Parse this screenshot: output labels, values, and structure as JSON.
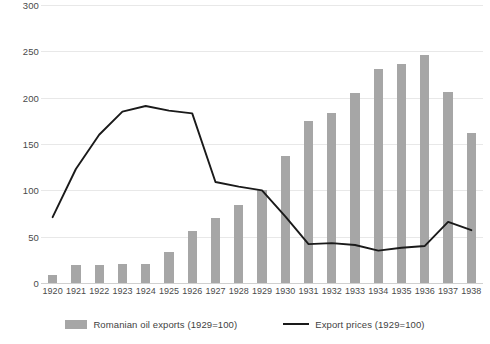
{
  "chart_data": {
    "type": "bar",
    "title": "",
    "xlabel": "",
    "ylabel": "",
    "ylim": [
      0,
      300
    ],
    "yticks": [
      0,
      50,
      100,
      150,
      200,
      250,
      300
    ],
    "grid": true,
    "legend_position": "bottom",
    "categories": [
      "1920",
      "1921",
      "1922",
      "1923",
      "1924",
      "1925",
      "1926",
      "1927",
      "1928",
      "1929",
      "1930",
      "1931",
      "1932",
      "1933",
      "1934",
      "1935",
      "1936",
      "1937",
      "1938"
    ],
    "series": [
      {
        "name": "Romanian oil exports (1929=100)",
        "type": "bar",
        "color": "#a6a6a6",
        "values": [
          9,
          19,
          19,
          21,
          20,
          34,
          56,
          70,
          84,
          100,
          137,
          175,
          183,
          205,
          231,
          236,
          246,
          206,
          162
        ]
      },
      {
        "name": "Export prices (1929=100)",
        "type": "line",
        "color": "#1a1a1a",
        "values": [
          71,
          123,
          160,
          185,
          191,
          186,
          183,
          109,
          104,
          100,
          72,
          42,
          43,
          41,
          35,
          38,
          40,
          66,
          57
        ]
      }
    ]
  },
  "legend": {
    "bar_label": "Romanian oil exports (1929=100)",
    "line_label": "Export prices (1929=100)"
  },
  "colors": {
    "bar": "#a6a6a6",
    "line": "#1a1a1a",
    "grid": "#e8e8e8",
    "text": "#4a4a4a",
    "background": "#ffffff"
  }
}
